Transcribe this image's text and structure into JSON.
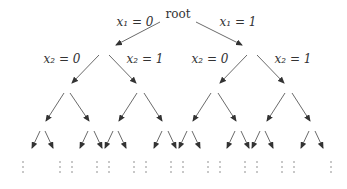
{
  "tree": {
    "root_label": "root",
    "edge_labels": {
      "x1_0": "x₁ = 0",
      "x1_1": "x₁ = 1",
      "x2_0_left": "x₂ = 0",
      "x2_1_left": "x₂ = 1",
      "x2_0_right": "x₂ = 0",
      "x2_1_right": "x₂ = 1"
    },
    "continuation_symbol": "⋮",
    "levels_shown": 4
  },
  "colors": {
    "arrow": "#444444",
    "text": "#333333",
    "background": "#ffffff"
  }
}
